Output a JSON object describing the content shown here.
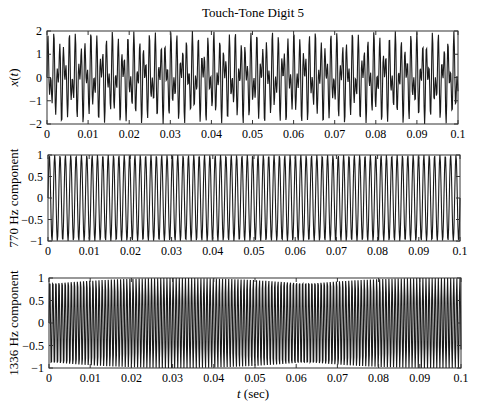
{
  "figure": {
    "title": "Touch-Tone Digit 5",
    "xlabel": "t (sec)",
    "xlabel_italic_part": "t",
    "xlabel_rest": " (sec)"
  },
  "chart_data": [
    {
      "type": "line",
      "title": "Touch-Tone Digit 5",
      "xlabel": "",
      "ylabel": "x(t)",
      "xlim": [
        0,
        0.1
      ],
      "ylim": [
        -2,
        2
      ],
      "xticks": [
        0,
        0.01,
        0.02,
        0.03,
        0.04,
        0.05,
        0.06,
        0.07,
        0.08,
        0.09,
        0.1
      ],
      "xtick_labels": [
        "0",
        "0.01",
        "0.02",
        "0.03",
        "0.04",
        "0.05",
        "0.06",
        "0.07",
        "0.08",
        "0.09",
        "0.1"
      ],
      "yticks": [
        -2,
        -1,
        0,
        1,
        2
      ],
      "ytick_labels": [
        "−2",
        "−1",
        "0",
        "1",
        "2"
      ],
      "grid": false,
      "series": [
        {
          "name": "x(t) = sin(2π·770t) + sin(2π·1336t)",
          "components_hz": [
            770,
            1336
          ],
          "amplitude": 1,
          "sample_rate_hz": 8000
        }
      ]
    },
    {
      "type": "line",
      "title": "",
      "xlabel": "",
      "ylabel": "770 Hz component",
      "xlim": [
        0,
        0.1
      ],
      "ylim": [
        -1,
        1
      ],
      "xticks": [
        0,
        0.01,
        0.02,
        0.03,
        0.04,
        0.05,
        0.06,
        0.07,
        0.08,
        0.09,
        0.1
      ],
      "xtick_labels": [
        "0",
        "0.01",
        "0.02",
        "0.03",
        "0.04",
        "0.05",
        "0.06",
        "0.07",
        "0.08",
        "0.09",
        "0.1"
      ],
      "yticks": [
        -1,
        -0.5,
        0,
        0.5,
        1
      ],
      "ytick_labels": [
        "−1",
        "−0.5",
        "0",
        "0.5",
        "1"
      ],
      "grid": false,
      "series": [
        {
          "name": "770 Hz component",
          "components_hz": [
            770
          ],
          "amplitude": 1,
          "sample_rate_hz": 8000
        }
      ]
    },
    {
      "type": "line",
      "title": "",
      "xlabel": "t (sec)",
      "ylabel": "1336 Hz component",
      "xlim": [
        0,
        0.1
      ],
      "ylim": [
        -1,
        1
      ],
      "xticks": [
        0,
        0.01,
        0.02,
        0.03,
        0.04,
        0.05,
        0.06,
        0.07,
        0.08,
        0.09,
        0.1
      ],
      "xtick_labels": [
        "0",
        "0.01",
        "0.02",
        "0.03",
        "0.04",
        "0.05",
        "0.06",
        "0.07",
        "0.08",
        "0.09",
        "0.1"
      ],
      "yticks": [
        -1,
        -0.5,
        0,
        0.5,
        1
      ],
      "ytick_labels": [
        "−1",
        "−0.5",
        "0",
        "0.5",
        "1"
      ],
      "grid": false,
      "series": [
        {
          "name": "1336 Hz component",
          "components_hz": [
            1336
          ],
          "amplitude": 1,
          "sample_rate_hz": 8000
        }
      ]
    }
  ],
  "layout": {
    "panels": [
      {
        "left": 47,
        "top": 31,
        "width": 411,
        "height": 93
      },
      {
        "left": 48,
        "top": 155,
        "width": 412,
        "height": 86
      },
      {
        "left": 49,
        "top": 278,
        "width": 412,
        "height": 90
      }
    ],
    "line_color": "#1a1a1a",
    "axis_color": "#333333"
  }
}
